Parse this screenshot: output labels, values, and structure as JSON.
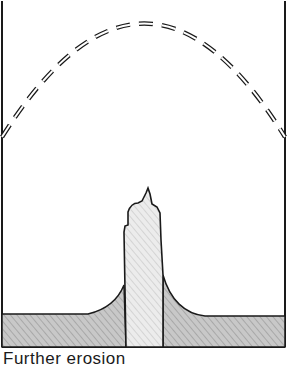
{
  "diagram": {
    "caption": "Further erosion",
    "elements": [
      {
        "name": "former-land-surface",
        "style": "dashed arch"
      },
      {
        "name": "volcanic-neck",
        "fill": "light hatched"
      },
      {
        "name": "surrounding-rock",
        "fill": "dark hatched"
      }
    ]
  },
  "colors": {
    "ink": "#1a1a1a",
    "neck_fill": "#e4e4e4",
    "rock_fill": "#c4c4c4"
  }
}
